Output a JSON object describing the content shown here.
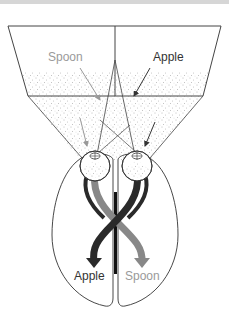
{
  "diagram": {
    "type": "split-brain visual field diagram",
    "screen": {
      "left_label": "Spoon",
      "right_label": "Apple"
    },
    "brain": {
      "left_hemisphere_label": "Apple",
      "right_hemisphere_label": "Spoon"
    },
    "colors": {
      "apple_path": "#2a2a2a",
      "spoon_path": "#8a8a8a",
      "spoon_text": "#9a9a9a",
      "apple_text": "#333333",
      "outline": "#333333",
      "stipple": "#777777"
    }
  }
}
